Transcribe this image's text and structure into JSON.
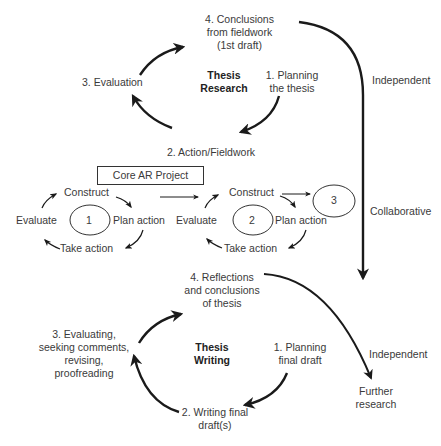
{
  "research_cycle": {
    "title_line1": "Thesis",
    "title_line2": "Research",
    "step1_line1": "1. Planning",
    "step1_line2": "the thesis",
    "step2": "2. Action/Fieldwork",
    "step3": "3. Evaluation",
    "step4_line1": "4. Conclusions",
    "step4_line2": "from fieldwork",
    "step4_line3": "(1st draft)"
  },
  "core_project": {
    "box_label": "Core AR Project",
    "cycle1": {
      "number": "1",
      "construct": "Construct",
      "plan": "Plan action",
      "take": "Take action",
      "evaluate": "Evaluate"
    },
    "cycle2": {
      "number": "2",
      "construct": "Construct",
      "plan": "Plan action",
      "take": "Take action",
      "evaluate": "Evaluate"
    },
    "cycle3": {
      "number": "3"
    }
  },
  "side_labels": {
    "independent_top": "Independent",
    "collaborative": "Collaborative",
    "independent_bottom": "Independent"
  },
  "writing_cycle": {
    "title_line1": "Thesis",
    "title_line2": "Writing",
    "step1_line1": "1. Planning",
    "step1_line2": "final draft",
    "step2_line1": "2. Writing final",
    "step2_line2": "draft(s)",
    "step3_line1": "3. Evaluating,",
    "step3_line2": "seeking comments,",
    "step3_line3": "revising,",
    "step3_line4": "proofreading",
    "step4_line1": "4. Reflections",
    "step4_line2": "and conclusions",
    "step4_line3": "of thesis"
  },
  "further_research": {
    "line1": "Further",
    "line2": "research"
  },
  "colors": {
    "stroke": "#1a1a1a",
    "text": "#3a3a3a"
  }
}
